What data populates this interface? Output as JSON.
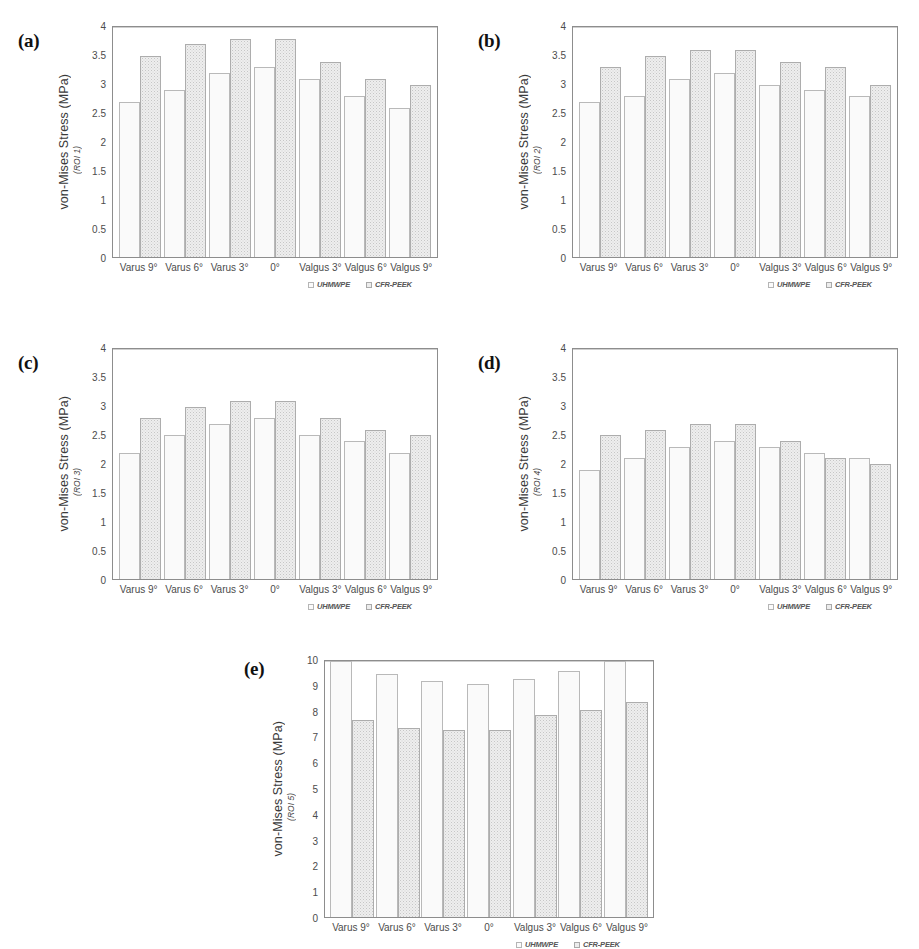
{
  "figure": {
    "series_names": [
      "UHMWPE",
      "CFR-PEEK"
    ],
    "categories": [
      "Varus 9°",
      "Varus 6°",
      "Varus 3°",
      "0°",
      "Valgus 3°",
      "Valgus 6°",
      "Valgus 9°"
    ],
    "ylabel_main": "von-Mises Stress (MPa)",
    "colors": {
      "series_uhmwpe": "#fafafa",
      "series_cfrpeek": "#eeeeee",
      "axis": "#8d8d8d",
      "text": "#4c4c4c",
      "background": "#ffffff"
    }
  },
  "chart_data": [
    {
      "type": "bar",
      "panel": "(a)",
      "title": "",
      "ylabel": "von-Mises Stress (MPa)",
      "ylabel_sub": "(ROI 1)",
      "xlabel": "",
      "ylim": [
        0,
        4
      ],
      "yticks": [
        0,
        0.5,
        1,
        1.5,
        2,
        2.5,
        3,
        3.5,
        4
      ],
      "ytick_labels": [
        "0",
        "0.5",
        "1",
        "1.5",
        "2",
        "2.5",
        "3",
        "3.5",
        "4"
      ],
      "grid": false,
      "legend_position": "bottom-right",
      "categories": [
        "Varus 9°",
        "Varus 6°",
        "Varus 3°",
        "0°",
        "Valgus 3°",
        "Valgus 6°",
        "Valgus 9°"
      ],
      "series": [
        {
          "name": "UHMWPE",
          "values": [
            2.7,
            2.9,
            3.2,
            3.3,
            3.1,
            2.8,
            2.6
          ]
        },
        {
          "name": "CFR-PEEK",
          "values": [
            3.5,
            3.7,
            3.8,
            3.8,
            3.4,
            3.1,
            3.0
          ]
        }
      ]
    },
    {
      "type": "bar",
      "panel": "(b)",
      "title": "",
      "ylabel": "von-Mises Stress (MPa)",
      "ylabel_sub": "(ROI 2)",
      "xlabel": "",
      "ylim": [
        0,
        4
      ],
      "yticks": [
        0,
        0.5,
        1,
        1.5,
        2,
        2.5,
        3,
        3.5,
        4
      ],
      "ytick_labels": [
        "0",
        "0.5",
        "1",
        "1.5",
        "2",
        "2.5",
        "3",
        "3.5",
        "4"
      ],
      "grid": false,
      "legend_position": "bottom-right",
      "categories": [
        "Varus 9°",
        "Varus 6°",
        "Varus 3°",
        "0°",
        "Valgus 3°",
        "Valgus 6°",
        "Valgus 9°"
      ],
      "series": [
        {
          "name": "UHMWPE",
          "values": [
            2.7,
            2.8,
            3.1,
            3.2,
            3.0,
            2.9,
            2.8
          ]
        },
        {
          "name": "CFR-PEEK",
          "values": [
            3.3,
            3.5,
            3.6,
            3.6,
            3.4,
            3.3,
            3.0
          ]
        }
      ]
    },
    {
      "type": "bar",
      "panel": "(c)",
      "title": "",
      "ylabel": "von-Mises Stress (MPa)",
      "ylabel_sub": "(ROI 3)",
      "xlabel": "",
      "ylim": [
        0,
        4
      ],
      "yticks": [
        0,
        0.5,
        1,
        1.5,
        2,
        2.5,
        3,
        3.5,
        4
      ],
      "ytick_labels": [
        "0",
        "0.5",
        "1",
        "1.5",
        "2",
        "2.5",
        "3",
        "3.5",
        "4"
      ],
      "grid": false,
      "legend_position": "bottom-right",
      "categories": [
        "Varus 9°",
        "Varus 6°",
        "Varus 3°",
        "0°",
        "Valgus 3°",
        "Valgus 6°",
        "Valgus 9°"
      ],
      "series": [
        {
          "name": "UHMWPE",
          "values": [
            2.2,
            2.5,
            2.7,
            2.8,
            2.5,
            2.4,
            2.2
          ]
        },
        {
          "name": "CFR-PEEK",
          "values": [
            2.8,
            3.0,
            3.1,
            3.1,
            2.8,
            2.6,
            2.5
          ]
        }
      ]
    },
    {
      "type": "bar",
      "panel": "(d)",
      "title": "",
      "ylabel": "von-Mises Stress (MPa)",
      "ylabel_sub": "(ROI 4)",
      "xlabel": "",
      "ylim": [
        0,
        4
      ],
      "yticks": [
        0,
        0.5,
        1,
        1.5,
        2,
        2.5,
        3,
        3.5,
        4
      ],
      "ytick_labels": [
        "0",
        "0.5",
        "1",
        "1.5",
        "2",
        "2.5",
        "3",
        "3.5",
        "4"
      ],
      "grid": false,
      "legend_position": "bottom-right",
      "categories": [
        "Varus 9°",
        "Varus 6°",
        "Varus 3°",
        "0°",
        "Valgus 3°",
        "Valgus 6°",
        "Valgus 9°"
      ],
      "series": [
        {
          "name": "UHMWPE",
          "values": [
            1.9,
            2.1,
            2.3,
            2.4,
            2.3,
            2.2,
            2.1
          ]
        },
        {
          "name": "CFR-PEEK",
          "values": [
            2.5,
            2.6,
            2.7,
            2.7,
            2.4,
            2.1,
            2.0
          ]
        }
      ]
    },
    {
      "type": "bar",
      "panel": "(e)",
      "title": "",
      "ylabel": "von-Mises Stress (MPa)",
      "ylabel_sub": "(ROI 5)",
      "xlabel": "",
      "ylim": [
        0,
        10
      ],
      "yticks": [
        0,
        1,
        2,
        3,
        4,
        5,
        6,
        7,
        8,
        9,
        10
      ],
      "ytick_labels": [
        "0",
        "1",
        "2",
        "3",
        "4",
        "5",
        "6",
        "7",
        "8",
        "9",
        "10"
      ],
      "grid": false,
      "legend_position": "bottom-right",
      "categories": [
        "Varus 9°",
        "Varus 6°",
        "Varus 3°",
        "0°",
        "Valgus 3°",
        "Valgus 6°",
        "Valgus 9°"
      ],
      "series": [
        {
          "name": "UHMWPE",
          "values": [
            10.0,
            9.5,
            9.2,
            9.1,
            9.3,
            9.6,
            10.0
          ]
        },
        {
          "name": "CFR-PEEK",
          "values": [
            7.7,
            7.4,
            7.3,
            7.3,
            7.9,
            8.1,
            8.4
          ]
        }
      ]
    }
  ]
}
